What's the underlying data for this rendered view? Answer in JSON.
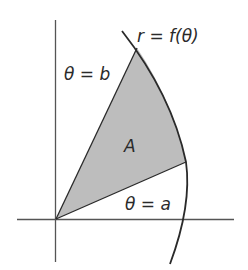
{
  "diagram": {
    "labels": {
      "curve": "r = f(θ)",
      "ray_upper": "θ = b",
      "ray_lower": "θ = a",
      "region": "A"
    },
    "colors": {
      "line": "#2a2a2a",
      "axis": "#555555",
      "fill": "#bdbdbd",
      "background": "#ffffff"
    }
  }
}
